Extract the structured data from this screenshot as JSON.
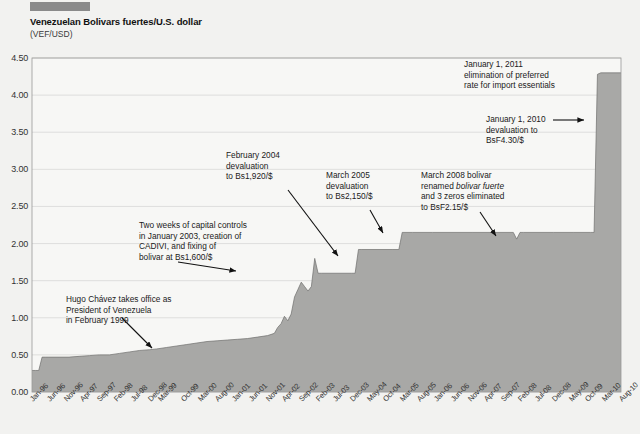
{
  "header": {
    "title": "Venezuelan Bolivars fuertes/U.S. dollar",
    "subtitle": "(VEF/USD)"
  },
  "chart_data": {
    "type": "area",
    "title": "Venezuelan Bolivars fuertes/U.S. dollar",
    "xlabel": "",
    "ylabel": "(VEF/USD)",
    "ylim": [
      0.0,
      4.5
    ],
    "ytick_labels": [
      "0.00",
      "0.50",
      "1.00",
      "1.50",
      "2.00",
      "2.50",
      "3.00",
      "3.50",
      "4.00",
      "4.50"
    ],
    "ytick_values": [
      0.0,
      0.5,
      1.0,
      1.5,
      2.0,
      2.5,
      3.0,
      3.5,
      4.0,
      4.5
    ],
    "grid": true,
    "legend": "none",
    "x_tick_labels": [
      "Jan-96",
      "Jun-96",
      "Nov-96",
      "Apr-97",
      "Sep-97",
      "Feb-98",
      "Jul-98",
      "Dec-98",
      "Mar-99",
      "Oct-99",
      "Mar-00",
      "Aug-00",
      "Jan-01",
      "Jun-01",
      "Nov-01",
      "Apr-02",
      "Sep-02",
      "Feb-03",
      "Jul-03",
      "Dec-03",
      "May-04",
      "Oct-04",
      "Mar-05",
      "Aug-05",
      "Jan-06",
      "Jun-06",
      "Nov-06",
      "Apr-07",
      "Sep-07",
      "Feb-08",
      "Jul-08",
      "Dec-08",
      "May-09",
      "Oct-09",
      "Mar-10",
      "Aug-10"
    ],
    "x_start": "Jan-96",
    "x_end": "Aug-10",
    "series": [
      {
        "name": "VEF/USD",
        "x": [
          "Jan-96",
          "Feb-96",
          "Mar-96",
          "Apr-96",
          "May-96",
          "Jun-96",
          "Sep-96",
          "Dec-96",
          "Mar-97",
          "Jun-97",
          "Sep-97",
          "Dec-97",
          "Mar-98",
          "Jun-98",
          "Sep-98",
          "Dec-98",
          "Feb-99",
          "May-99",
          "Aug-99",
          "Nov-99",
          "Feb-00",
          "May-00",
          "Aug-00",
          "Nov-00",
          "Feb-01",
          "May-01",
          "Aug-01",
          "Nov-01",
          "Jan-02",
          "Feb-02",
          "Mar-02",
          "Apr-02",
          "May-02",
          "Jun-02",
          "Jul-02",
          "Aug-02",
          "Sep-02",
          "Oct-02",
          "Nov-02",
          "Dec-02",
          "Jan-03",
          "Feb-03",
          "Mar-03",
          "Dec-03",
          "Jan-04",
          "Feb-04",
          "Mar-04",
          "Dec-04",
          "Feb-05",
          "Mar-05",
          "Jun-05",
          "Dec-05",
          "Dec-06",
          "Dec-07",
          "Jan-08",
          "Feb-08",
          "Mar-08",
          "Dec-08",
          "Jun-09",
          "Nov-09",
          "Dec-09",
          "Jan-10",
          "Feb-10",
          "Aug-10"
        ],
        "values": [
          0.29,
          0.29,
          0.29,
          0.47,
          0.47,
          0.47,
          0.47,
          0.47,
          0.48,
          0.49,
          0.5,
          0.5,
          0.52,
          0.54,
          0.56,
          0.57,
          0.58,
          0.6,
          0.62,
          0.64,
          0.66,
          0.68,
          0.69,
          0.7,
          0.71,
          0.72,
          0.74,
          0.76,
          0.79,
          0.87,
          0.92,
          1.02,
          0.96,
          1.05,
          1.28,
          1.38,
          1.48,
          1.42,
          1.36,
          1.42,
          1.8,
          1.6,
          1.6,
          1.6,
          1.6,
          1.92,
          1.92,
          1.92,
          1.92,
          2.15,
          2.15,
          2.15,
          2.15,
          2.15,
          2.06,
          2.15,
          2.15,
          2.15,
          2.15,
          2.15,
          2.15,
          4.28,
          4.3,
          4.3
        ]
      }
    ],
    "annotations": [
      {
        "id": "chavez",
        "lines": [
          "Hugo Chávez takes office as",
          "President of Venezuela",
          "in February 1999"
        ],
        "arrow": true
      },
      {
        "id": "capital-controls-2003",
        "lines": [
          "Two weeks of capital controls",
          "in January 2003, creation of",
          "CADIVI, and fixing of",
          "bolivar at Bs1,600/$"
        ],
        "arrow": true
      },
      {
        "id": "devaluation-2004",
        "lines": [
          "February 2004",
          "devaluation",
          "to Bs1,920/$"
        ],
        "arrow": true
      },
      {
        "id": "devaluation-2005",
        "lines": [
          "March 2005",
          "devaluation",
          "to Bs2,150/$"
        ],
        "arrow": true
      },
      {
        "id": "redenomination-2008",
        "lines": [
          "March 2008 bolivar",
          "renamed ",
          "and 3 zeros eliminated",
          "to BsF2.15/$"
        ],
        "italic_part": "bolivar fuerte",
        "arrow": true
      },
      {
        "id": "devaluation-2010",
        "lines": [
          "January 1, 2010",
          "devaluation to",
          "BsF4.30/$"
        ],
        "arrow": true
      },
      {
        "id": "preferred-rate-2011",
        "lines": [
          "January 1, 2011",
          "elimination of preferred",
          "rate for import essentials"
        ],
        "arrow": false
      }
    ]
  },
  "colors": {
    "area_fill": "#a8a8a6",
    "background": "#f2f2f0",
    "plot_background": "#f7f7f5",
    "grid": "#d4d4d2",
    "axis": "#8f8f8d",
    "text": "#1a1a1a",
    "topbar": "#8a8a8a"
  }
}
